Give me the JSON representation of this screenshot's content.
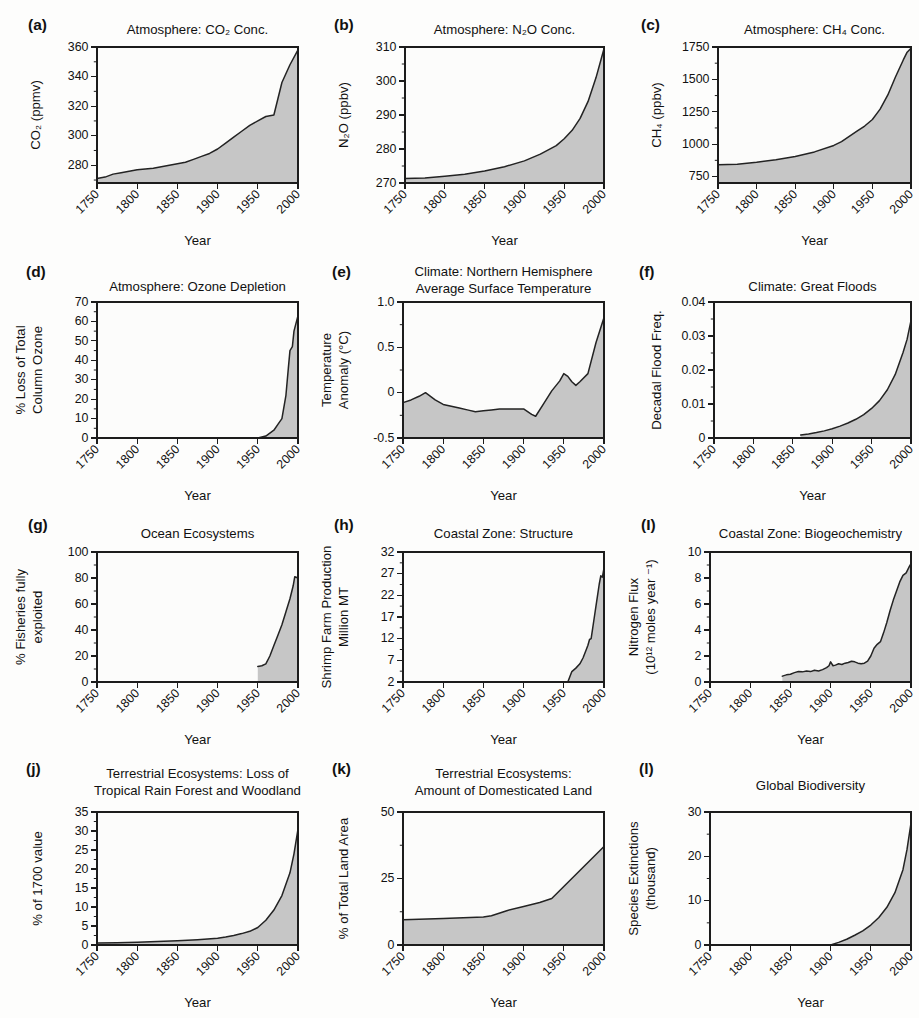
{
  "figure": {
    "background_color": "#fdfdfc",
    "plot_background_color": "#fcfcfb",
    "fill_color": "#c6c6c6",
    "line_color": "#232323",
    "axis_color": "#1c1c1c",
    "shared_xlabel": "Year",
    "shared_xticks": [
      "1750",
      "1800",
      "1850",
      "1900",
      "1950",
      "2000"
    ],
    "columns": 3,
    "rows": 4,
    "panel_count": 12
  },
  "chart_data": [
    {
      "id": "a",
      "tag": "(a)",
      "type": "area",
      "title": "Atmosphere: CO₂ Conc.",
      "title_lines": [
        "Atmosphere: CO₂ Conc."
      ],
      "xlabel": "Year",
      "ylabel_lines": [
        "CO₂ (ppmv)"
      ],
      "xlim": [
        1750,
        2000
      ],
      "ylim": [
        268,
        360
      ],
      "xticks": [
        1750,
        1800,
        1850,
        1900,
        1950,
        2000
      ],
      "xticklabels": [
        "1750",
        "1800",
        "1850",
        "1900",
        "1950",
        "2000"
      ],
      "yticks": [
        280,
        300,
        320,
        340,
        360
      ],
      "yticklabels": [
        "280",
        "300",
        "320",
        "340",
        "360"
      ],
      "yminor": [
        270,
        290,
        310,
        330,
        350
      ],
      "grid": false,
      "x": [
        1750,
        1760,
        1770,
        1780,
        1790,
        1800,
        1810,
        1820,
        1830,
        1840,
        1850,
        1860,
        1870,
        1880,
        1890,
        1900,
        1910,
        1920,
        1930,
        1940,
        1950,
        1960,
        1970,
        1975,
        1980,
        1990,
        2000
      ],
      "y": [
        271,
        272,
        274,
        275,
        276,
        277,
        277.5,
        278,
        279,
        280,
        281,
        282,
        284,
        286,
        288,
        291,
        295,
        299,
        303,
        307,
        310,
        313,
        314,
        325,
        336,
        348,
        358
      ]
    },
    {
      "id": "b",
      "tag": "(b)",
      "type": "area",
      "title": "Atmosphere: N₂O Conc.",
      "title_lines": [
        "Atmosphere: N₂O Conc."
      ],
      "xlabel": "Year",
      "ylabel_lines": [
        "N₂O (ppbv)"
      ],
      "xlim": [
        1750,
        2000
      ],
      "ylim": [
        270,
        310
      ],
      "xticks": [
        1750,
        1800,
        1850,
        1900,
        1950,
        2000
      ],
      "xticklabels": [
        "1750",
        "1800",
        "1850",
        "1900",
        "1950",
        "2000"
      ],
      "yticks": [
        270,
        280,
        290,
        300,
        310
      ],
      "yticklabels": [
        "270",
        "280",
        "290",
        "300",
        "310"
      ],
      "yminor": [
        275,
        285,
        295,
        305
      ],
      "grid": false,
      "x": [
        1750,
        1775,
        1800,
        1825,
        1850,
        1875,
        1900,
        1920,
        1940,
        1950,
        1960,
        1970,
        1980,
        1990,
        2000
      ],
      "y": [
        271.3,
        271.5,
        272,
        272.6,
        273.5,
        274.8,
        276.5,
        278.5,
        281,
        283,
        285.5,
        289,
        294,
        301,
        309.5
      ]
    },
    {
      "id": "c",
      "tag": "(c)",
      "type": "area",
      "title": "Atmosphere: CH₄ Conc.",
      "title_lines": [
        "Atmosphere: CH₄ Conc."
      ],
      "xlabel": "Year",
      "ylabel_lines": [
        "CH₄ (ppbv)"
      ],
      "xlim": [
        1750,
        2000
      ],
      "ylim": [
        700,
        1750
      ],
      "xticks": [
        1750,
        1800,
        1850,
        1900,
        1950,
        2000
      ],
      "xticklabels": [
        "1750",
        "1800",
        "1850",
        "1900",
        "1950",
        "2000"
      ],
      "yticks": [
        750,
        1000,
        1250,
        1500,
        1750
      ],
      "yticklabels": [
        "750",
        "1000",
        "1250",
        "1500",
        "1750"
      ],
      "yminor": [
        875,
        1125,
        1375,
        1625
      ],
      "grid": false,
      "x": [
        1750,
        1775,
        1800,
        1825,
        1850,
        1875,
        1900,
        1910,
        1920,
        1930,
        1940,
        1950,
        1960,
        1970,
        1980,
        1990,
        1995,
        2000
      ],
      "y": [
        840,
        845,
        860,
        880,
        905,
        940,
        990,
        1020,
        1060,
        1100,
        1140,
        1190,
        1270,
        1380,
        1520,
        1650,
        1710,
        1740
      ]
    },
    {
      "id": "d",
      "tag": "(d)",
      "type": "area",
      "title": "Atmosphere: Ozone Depletion",
      "title_lines": [
        "Atmosphere: Ozone Depletion"
      ],
      "xlabel": "Year",
      "ylabel_lines": [
        "% Loss of Total",
        "Column Ozone"
      ],
      "xlim": [
        1750,
        2000
      ],
      "ylim": [
        0,
        70
      ],
      "xticks": [
        1750,
        1800,
        1850,
        1900,
        1950,
        2000
      ],
      "xticklabels": [
        "1750",
        "1800",
        "1850",
        "1900",
        "1950",
        "2000"
      ],
      "yticks": [
        0,
        10,
        20,
        30,
        40,
        50,
        60,
        70
      ],
      "yticklabels": [
        "0",
        "10",
        "20",
        "30",
        "40",
        "50",
        "60",
        "70"
      ],
      "yminor": [
        5,
        15,
        25,
        35,
        45,
        55,
        65
      ],
      "grid": false,
      "x": [
        1750,
        1950,
        1960,
        1970,
        1975,
        1980,
        1985,
        1988,
        1990,
        1993,
        1995,
        2000
      ],
      "y": [
        0,
        0,
        1,
        4,
        7,
        10,
        22,
        36,
        45,
        47,
        55,
        63
      ]
    },
    {
      "id": "e",
      "tag": "(e)",
      "type": "area",
      "title": "Climate: Northern Hemisphere Average Surface Temperature",
      "title_lines": [
        "Climate: Northern Hemisphere",
        "Average Surface Temperature"
      ],
      "xlabel": "Year",
      "ylabel_lines": [
        "Temperature",
        "Anomaly (°C)"
      ],
      "xlim": [
        1750,
        2000
      ],
      "ylim": [
        -0.5,
        1.0
      ],
      "xticks": [
        1750,
        1800,
        1850,
        1900,
        1950,
        2000
      ],
      "xticklabels": [
        "1750",
        "1800",
        "1850",
        "1900",
        "1950",
        "2000"
      ],
      "yticks": [
        -0.5,
        0,
        0.5,
        1.0
      ],
      "yticklabels": [
        "-0.5",
        "0",
        "0.5",
        "1.0"
      ],
      "yminor": [
        -0.25,
        0.25,
        0.75
      ],
      "grid": false,
      "x": [
        1750,
        1760,
        1770,
        1778,
        1790,
        1800,
        1810,
        1820,
        1830,
        1840,
        1850,
        1860,
        1870,
        1880,
        1890,
        1900,
        1910,
        1915,
        1925,
        1935,
        1945,
        1950,
        1955,
        1960,
        1965,
        1970,
        1980,
        1990,
        2000
      ],
      "y": [
        -0.11,
        -0.08,
        -0.04,
        0.0,
        -0.08,
        -0.13,
        -0.15,
        -0.17,
        -0.19,
        -0.21,
        -0.2,
        -0.19,
        -0.18,
        -0.18,
        -0.18,
        -0.18,
        -0.24,
        -0.26,
        -0.12,
        0.02,
        0.13,
        0.21,
        0.18,
        0.12,
        0.08,
        0.12,
        0.21,
        0.55,
        0.83
      ]
    },
    {
      "id": "f",
      "tag": "(f)",
      "type": "area",
      "title": "Climate: Great Floods",
      "title_lines": [
        "Climate: Great Floods"
      ],
      "xlabel": "Year",
      "ylabel_lines": [
        "Decadal Flood Freq."
      ],
      "xlim": [
        1750,
        2000
      ],
      "ylim": [
        0,
        0.04
      ],
      "xticks": [
        1750,
        1800,
        1850,
        1900,
        1950,
        2000
      ],
      "xticklabels": [
        "1750",
        "1800",
        "1850",
        "1900",
        "1950",
        "2000"
      ],
      "yticks": [
        0,
        0.01,
        0.02,
        0.03,
        0.04
      ],
      "yticklabels": [
        "0",
        "0.01",
        "0.02",
        "0.03",
        "0.04"
      ],
      "yminor": [
        0.005,
        0.015,
        0.025,
        0.035
      ],
      "grid": false,
      "x": [
        1860,
        1870,
        1880,
        1890,
        1900,
        1910,
        1920,
        1930,
        1940,
        1950,
        1960,
        1970,
        1980,
        1990,
        1995,
        2000
      ],
      "y": [
        0.0009,
        0.0012,
        0.0016,
        0.0021,
        0.0027,
        0.0035,
        0.0044,
        0.0055,
        0.0069,
        0.0087,
        0.011,
        0.0142,
        0.0187,
        0.0252,
        0.029,
        0.0345
      ]
    },
    {
      "id": "g",
      "tag": "(g)",
      "type": "area",
      "title": "Ocean Ecosystems",
      "title_lines": [
        "Ocean Ecosystems"
      ],
      "xlabel": "Year",
      "ylabel_lines": [
        "% Fisheries fully",
        "exploited"
      ],
      "xlim": [
        1750,
        2000
      ],
      "ylim": [
        0,
        100
      ],
      "xticks": [
        1750,
        1800,
        1850,
        1900,
        1950,
        2000
      ],
      "xticklabels": [
        "1750",
        "1800",
        "1850",
        "1900",
        "1950",
        "2000"
      ],
      "yticks": [
        0,
        20,
        40,
        60,
        80,
        100
      ],
      "yticklabels": [
        "0",
        "20",
        "40",
        "60",
        "80",
        "100"
      ],
      "yminor": [
        10,
        30,
        50,
        70,
        90
      ],
      "grid": false,
      "x": [
        1950,
        1955,
        1960,
        1965,
        1970,
        1975,
        1980,
        1985,
        1990,
        1994,
        1996,
        2000
      ],
      "y": [
        12,
        12.5,
        14,
        20,
        28,
        36,
        44,
        54,
        64,
        74,
        81,
        80
      ]
    },
    {
      "id": "h",
      "tag": "(h)",
      "type": "area",
      "title": "Coastal Zone: Structure",
      "title_lines": [
        "Coastal Zone: Structure"
      ],
      "xlabel": "Year",
      "ylabel_lines": [
        "Shrimp Farm Production",
        "Million MT"
      ],
      "xlim": [
        1750,
        2000
      ],
      "ylim": [
        2,
        32
      ],
      "xticks": [
        1750,
        1800,
        1850,
        1900,
        1950,
        2000
      ],
      "xticklabels": [
        "1750",
        "1800",
        "1850",
        "1900",
        "1950",
        "2000"
      ],
      "yticks": [
        2,
        7,
        12,
        17,
        22,
        27,
        32
      ],
      "yticklabels": [
        "2",
        "7",
        "12",
        "17",
        "22",
        "27",
        "32"
      ],
      "yminor": [
        4.5,
        9.5,
        14.5,
        19.5,
        24.5,
        29.5
      ],
      "grid": false,
      "x": [
        1955,
        1960,
        1965,
        1970,
        1974,
        1978,
        1980,
        1982,
        1984,
        1986,
        1988,
        1990,
        1992,
        1994,
        1996,
        1998,
        2000
      ],
      "y": [
        2,
        4.4,
        5.2,
        6.2,
        7.6,
        9.5,
        10.5,
        11.8,
        12.0,
        14.5,
        17.0,
        19.5,
        22.0,
        24.5,
        26.5,
        26.2,
        28.3
      ]
    },
    {
      "id": "i",
      "tag": "(I)",
      "type": "area",
      "title": "Coastal Zone: Biogeochemistry",
      "title_lines": [
        "Coastal Zone: Biogeochemistry"
      ],
      "xlabel": "Year",
      "ylabel_lines": [
        "Nitrogen Flux",
        "(10¹² moles year ⁻¹)"
      ],
      "xlim": [
        1750,
        2000
      ],
      "ylim": [
        0,
        10
      ],
      "xticks": [
        1750,
        1800,
        1850,
        1900,
        1950,
        2000
      ],
      "xticklabels": [
        "1750",
        "1800",
        "1850",
        "1900",
        "1950",
        "2000"
      ],
      "yticks": [
        0,
        2,
        4,
        6,
        8,
        10
      ],
      "yticklabels": [
        "0",
        "2",
        "4",
        "6",
        "8",
        "10"
      ],
      "yminor": [
        1,
        3,
        5,
        7,
        9
      ],
      "grid": false,
      "x": [
        1840,
        1845,
        1850,
        1855,
        1860,
        1865,
        1870,
        1875,
        1880,
        1885,
        1890,
        1895,
        1898,
        1900,
        1903,
        1906,
        1910,
        1914,
        1918,
        1922,
        1926,
        1930,
        1934,
        1938,
        1942,
        1946,
        1950,
        1954,
        1958,
        1962,
        1966,
        1970,
        1974,
        1978,
        1982,
        1986,
        1990,
        1994,
        1998,
        2000
      ],
      "y": [
        0.45,
        0.55,
        0.6,
        0.72,
        0.8,
        0.78,
        0.85,
        0.8,
        0.9,
        0.85,
        0.95,
        1.1,
        1.25,
        1.55,
        1.25,
        1.3,
        1.4,
        1.35,
        1.45,
        1.5,
        1.6,
        1.55,
        1.45,
        1.4,
        1.45,
        1.6,
        2.0,
        2.6,
        2.9,
        3.1,
        3.8,
        4.6,
        5.5,
        6.3,
        7.0,
        7.7,
        8.2,
        8.4,
        8.9,
        9.1
      ]
    },
    {
      "id": "j",
      "tag": "(j)",
      "type": "area",
      "title": "Terrestrial Ecosystems: Loss of Tropical Rain Forest and Woodland",
      "title_lines": [
        "Terrestrial Ecosystems: Loss of",
        "Tropical Rain Forest and Woodland"
      ],
      "xlabel": "Year",
      "ylabel_lines": [
        "% of 1700 value"
      ],
      "xlim": [
        1750,
        2000
      ],
      "ylim": [
        0,
        35
      ],
      "xticks": [
        1750,
        1800,
        1850,
        1900,
        1950,
        2000
      ],
      "xticklabels": [
        "1750",
        "1800",
        "1850",
        "1900",
        "1950",
        "2000"
      ],
      "yticks": [
        0,
        5,
        10,
        15,
        20,
        25,
        30,
        35
      ],
      "yticklabels": [
        "0",
        "5",
        "10",
        "15",
        "20",
        "25",
        "30",
        "35"
      ],
      "yminor": [
        2.5,
        7.5,
        12.5,
        17.5,
        22.5,
        27.5,
        32.5
      ],
      "grid": false,
      "x": [
        1750,
        1775,
        1800,
        1825,
        1850,
        1875,
        1900,
        1910,
        1920,
        1930,
        1940,
        1950,
        1960,
        1970,
        1980,
        1990,
        1995,
        2000
      ],
      "y": [
        0.5,
        0.6,
        0.7,
        0.9,
        1.1,
        1.4,
        1.8,
        2.1,
        2.5,
        3.0,
        3.6,
        4.6,
        6.5,
        9.2,
        13.0,
        19.0,
        24.0,
        30.5
      ]
    },
    {
      "id": "k",
      "tag": "(k)",
      "type": "area",
      "title": "Terrestrial Ecosystems: Amount of Domesticated Land",
      "title_lines": [
        "Terrestrial Ecosystems:",
        "Amount of Domesticated Land"
      ],
      "xlabel": "Year",
      "ylabel_lines": [
        "% of Total Land Area"
      ],
      "xlim": [
        1750,
        2000
      ],
      "ylim": [
        0,
        50
      ],
      "xticks": [
        1750,
        1800,
        1850,
        1900,
        1950,
        2000
      ],
      "xticklabels": [
        "1750",
        "1800",
        "1850",
        "1900",
        "1950",
        "2000"
      ],
      "yticks": [
        0,
        25,
        50
      ],
      "yticklabels": [
        "0",
        "25",
        "50"
      ],
      "yminor": [
        12.5,
        37.5
      ],
      "grid": false,
      "x": [
        1750,
        1800,
        1850,
        1860,
        1880,
        1900,
        1920,
        1935,
        1950,
        1970,
        1990,
        2000
      ],
      "y": [
        9.5,
        10.0,
        10.5,
        11.0,
        13.0,
        14.5,
        16.0,
        17.5,
        22.0,
        28.0,
        34.0,
        37.0
      ]
    },
    {
      "id": "l",
      "tag": "(l)",
      "type": "area",
      "title": "Global Biodiversity",
      "title_lines": [
        "Global Biodiversity"
      ],
      "xlabel": "Year",
      "ylabel_lines": [
        "Species Extinctions",
        "(thousand)"
      ],
      "xlim": [
        1750,
        2000
      ],
      "ylim": [
        0,
        30
      ],
      "xticks": [
        1750,
        1800,
        1850,
        1900,
        1950,
        2000
      ],
      "xticklabels": [
        "1750",
        "1800",
        "1850",
        "1900",
        "1950",
        "2000"
      ],
      "yticks": [
        0,
        10,
        20,
        30
      ],
      "yticklabels": [
        "0",
        "10",
        "20",
        "30"
      ],
      "yminor": [
        5,
        15,
        25
      ],
      "grid": false,
      "x": [
        1750,
        1900,
        1910,
        1920,
        1930,
        1940,
        1950,
        1960,
        1970,
        1980,
        1990,
        1995,
        2000
      ],
      "y": [
        0,
        0,
        0.6,
        1.3,
        2.2,
        3.2,
        4.5,
        6.2,
        8.5,
        11.8,
        17.0,
        21.5,
        27.5
      ]
    }
  ]
}
